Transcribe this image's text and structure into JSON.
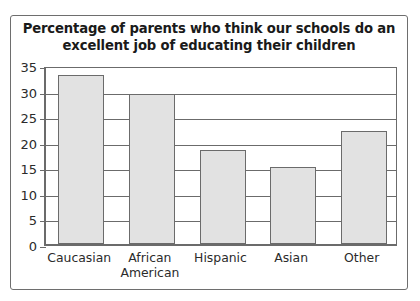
{
  "chart_data": {
    "type": "bar",
    "title": "Percentage of parents who think our schools do an excellent job of educating their children",
    "title_lines": [
      "Percentage of parents who think our schools do an",
      "excellent job of educating their children"
    ],
    "categories": [
      "Caucasian",
      "African American",
      "Hispanic",
      "Asian",
      "Other"
    ],
    "category_lines": [
      [
        "Caucasian"
      ],
      [
        "African",
        "American"
      ],
      [
        "Hispanic"
      ],
      [
        "Asian"
      ],
      [
        "Other"
      ]
    ],
    "values": [
      33,
      29.3,
      18.3,
      15,
      22.1
    ],
    "xlabel": "",
    "ylabel": "",
    "ylim": [
      0,
      35
    ],
    "ytick_labels": [
      "35",
      "30",
      "25",
      "20",
      "15",
      "10",
      "5",
      "0"
    ],
    "ytick_values": [
      35,
      30,
      25,
      20,
      15,
      10,
      5,
      0
    ],
    "ytick_step": 5,
    "grid": true,
    "legend": "none",
    "colors": {
      "bar_fill": "#e2e2e2",
      "bar_edge": "#6b6b6b",
      "axis": "#6b6b6b",
      "frame": "#6e6e6e",
      "text": "#2b2b2b",
      "title_text": "#1a1a1a",
      "background": "#ffffff"
    }
  }
}
